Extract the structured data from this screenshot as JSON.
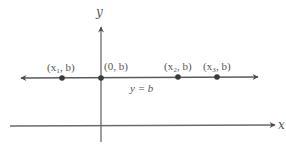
{
  "diagram": {
    "axes": {
      "x_label": "x",
      "y_label": "y"
    },
    "horizontal_line": {
      "equation": "y = b",
      "equation_parts": {
        "lhs": "y",
        "op": " = ",
        "rhs": "b"
      }
    },
    "points": [
      {
        "label": "(x₁, b)",
        "name": "x1",
        "px": 62
      },
      {
        "label": "(0, b)",
        "name": "origin",
        "px": 101
      },
      {
        "label": "(x₂, b)",
        "name": "x2",
        "px": 178
      },
      {
        "label": "(x₃, b)",
        "name": "x3",
        "px": 217
      }
    ],
    "colors": {
      "line": "#5a5a5a",
      "point": "#3a3a3a",
      "text": "#555555",
      "background": "#ffffff"
    }
  }
}
